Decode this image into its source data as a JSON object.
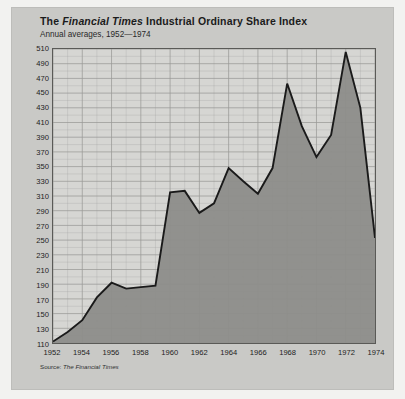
{
  "figure": {
    "title_prefix": "The ",
    "title_italic": "Financial Times",
    "title_suffix": " Industrial Ordinary Share Index",
    "subtitle": "Annual averages, 1952—1974",
    "source_prefix": "Source: ",
    "source_italic": "The Financial Times",
    "background": "#c9c9c6",
    "plot_background": "#d6d6d3",
    "area_fill": "#8d8d8a",
    "line_color": "#1a1a1a",
    "grid_color": "#9a9a97"
  },
  "chart_data": {
    "type": "area",
    "title": "The Financial Times Industrial Ordinary Share Index",
    "subtitle": "Annual averages, 1952—1974",
    "xlabel": "",
    "ylabel": "",
    "source": "Source: The Financial Times",
    "grid": true,
    "legend": "none",
    "xlim": [
      1952,
      1974
    ],
    "ylim": [
      110,
      510
    ],
    "ytick_step": 20,
    "xtick_step": 2,
    "x": [
      1952,
      1953,
      1954,
      1955,
      1956,
      1957,
      1958,
      1959,
      1960,
      1961,
      1962,
      1963,
      1964,
      1965,
      1966,
      1967,
      1968,
      1969,
      1970,
      1971,
      1972,
      1973,
      1974
    ],
    "values": [
      112,
      125,
      141,
      172,
      192,
      184,
      186,
      188,
      315,
      317,
      287,
      300,
      348,
      330,
      313,
      348,
      463,
      405,
      363,
      393,
      506,
      430,
      253
    ],
    "yticks": [
      110,
      130,
      150,
      170,
      190,
      210,
      230,
      250,
      270,
      290,
      310,
      330,
      350,
      370,
      390,
      410,
      430,
      450,
      470,
      490,
      510
    ],
    "xticks": [
      1952,
      1954,
      1956,
      1958,
      1960,
      1962,
      1964,
      1966,
      1968,
      1970,
      1972,
      1974
    ],
    "annotations": []
  }
}
